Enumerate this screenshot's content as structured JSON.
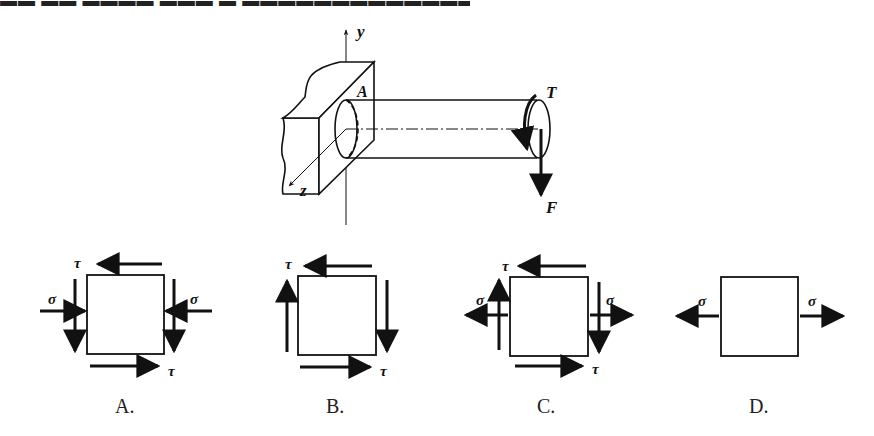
{
  "header_fragment": "▬▬ ▬▬ ▬▬▬▬ ▬▬▬ ▬ ▬▬▬▬▬▬▬▬▬▬▬▬▬",
  "main_figure": {
    "axis_y_label": "y",
    "axis_z_label": "z",
    "section_label": "A",
    "torque_label": "T",
    "force_label": "F"
  },
  "options": [
    {
      "id": "A",
      "label": "A.",
      "tau": "τ",
      "sigma": "σ",
      "sigma_type": "compressive",
      "has_shear": true
    },
    {
      "id": "B",
      "label": "B.",
      "tau": "τ",
      "sigma": "",
      "sigma_type": "none",
      "has_shear": true
    },
    {
      "id": "C",
      "label": "C.",
      "tau": "τ",
      "sigma": "σ",
      "sigma_type": "tensile",
      "has_shear": true
    },
    {
      "id": "D",
      "label": "D.",
      "tau": "",
      "sigma": "σ",
      "sigma_type": "tensile",
      "has_shear": false
    }
  ],
  "colors": {
    "ink": "#111111",
    "background": "#ffffff"
  }
}
